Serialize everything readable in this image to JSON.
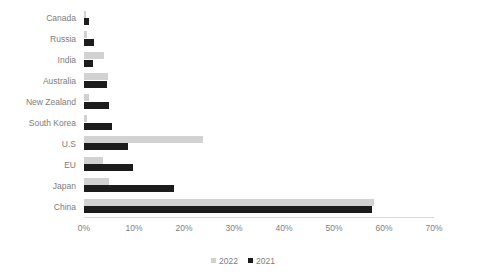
{
  "chart_data": {
    "type": "bar",
    "orientation": "horizontal",
    "title": "",
    "xlabel": "",
    "ylabel": "",
    "xlim": [
      0,
      70
    ],
    "xtick_labels": [
      "0%",
      "10%",
      "20%",
      "30%",
      "40%",
      "50%",
      "60%",
      "70%"
    ],
    "xtick_values": [
      0,
      10,
      20,
      30,
      40,
      50,
      60,
      70
    ],
    "grid": false,
    "legend_position": "bottom",
    "value_unit": "%",
    "categories": [
      "Canada",
      "Russia",
      "India",
      "Australia",
      "New Zealand",
      "South Korea",
      "U.S",
      "EU",
      "Japan",
      "China"
    ],
    "series": [
      {
        "name": "2022",
        "color": "#d2d2d2",
        "values": [
          0.4,
          0.5,
          4.0,
          4.8,
          1.0,
          0.6,
          23.8,
          3.8,
          5.0,
          58.0
        ]
      },
      {
        "name": "2021",
        "color": "#1c1c1c",
        "values": [
          1.0,
          2.0,
          1.8,
          4.5,
          5.0,
          5.5,
          8.8,
          9.8,
          18.0,
          57.6
        ]
      }
    ]
  },
  "legend": {
    "items": [
      {
        "label": "2022",
        "series_key": "2022"
      },
      {
        "label": "2021",
        "series_key": "2021"
      }
    ]
  }
}
